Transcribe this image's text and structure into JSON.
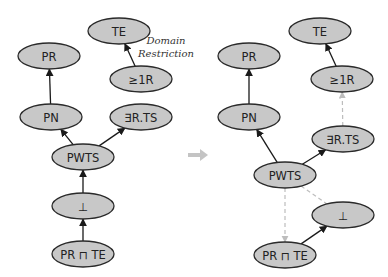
{
  "annotation": {
    "line1": "Domain",
    "line2": "Restriction"
  },
  "transition_arrow": "right-arrow",
  "left_graph": {
    "nodes": [
      {
        "id": "PR",
        "label": "PR"
      },
      {
        "id": "TE",
        "label": "TE"
      },
      {
        "id": "GE1R",
        "label": "≥1R"
      },
      {
        "id": "PN",
        "label": "PN"
      },
      {
        "id": "EXRTS",
        "label": "∃R.TS"
      },
      {
        "id": "PWTS",
        "label": "PWTS"
      },
      {
        "id": "BOT",
        "label": "⊥"
      },
      {
        "id": "PRTE",
        "label": "PR ⊓ TE"
      }
    ],
    "edges": [
      {
        "from": "PN",
        "to": "PR",
        "style": "solid"
      },
      {
        "from": "GE1R",
        "to": "TE",
        "style": "solid"
      },
      {
        "from": "PWTS",
        "to": "PN",
        "style": "solid"
      },
      {
        "from": "PWTS",
        "to": "EXRTS",
        "style": "solid"
      },
      {
        "from": "BOT",
        "to": "PWTS",
        "style": "solid"
      },
      {
        "from": "PRTE",
        "to": "BOT",
        "style": "solid"
      }
    ]
  },
  "right_graph": {
    "nodes": [
      {
        "id": "PR",
        "label": "PR"
      },
      {
        "id": "TE",
        "label": "TE"
      },
      {
        "id": "GE1R",
        "label": "≥1R"
      },
      {
        "id": "PN",
        "label": "PN"
      },
      {
        "id": "EXRTS",
        "label": "∃R.TS"
      },
      {
        "id": "PWTS",
        "label": "PWTS"
      },
      {
        "id": "BOT",
        "label": "⊥"
      },
      {
        "id": "PRTE",
        "label": "PR ⊓ TE"
      }
    ],
    "edges": [
      {
        "from": "PN",
        "to": "PR",
        "style": "solid"
      },
      {
        "from": "GE1R",
        "to": "TE",
        "style": "solid"
      },
      {
        "from": "EXRTS",
        "to": "GE1R",
        "style": "dashed"
      },
      {
        "from": "PWTS",
        "to": "PN",
        "style": "solid"
      },
      {
        "from": "PWTS",
        "to": "EXRTS",
        "style": "solid"
      },
      {
        "from": "PWTS",
        "to": "PRTE",
        "style": "dashed"
      },
      {
        "from": "PWTS",
        "to": "BOT",
        "style": "dashed-noarrow"
      },
      {
        "from": "PRTE",
        "to": "BOT",
        "style": "solid"
      }
    ]
  },
  "colors": {
    "node_fill": "#c8c8c8",
    "node_stroke": "#2a2a2a",
    "edge_solid": "#1a1a1a",
    "edge_dashed": "#bdbdbd",
    "transition_arrow": "#c4c4c4"
  }
}
